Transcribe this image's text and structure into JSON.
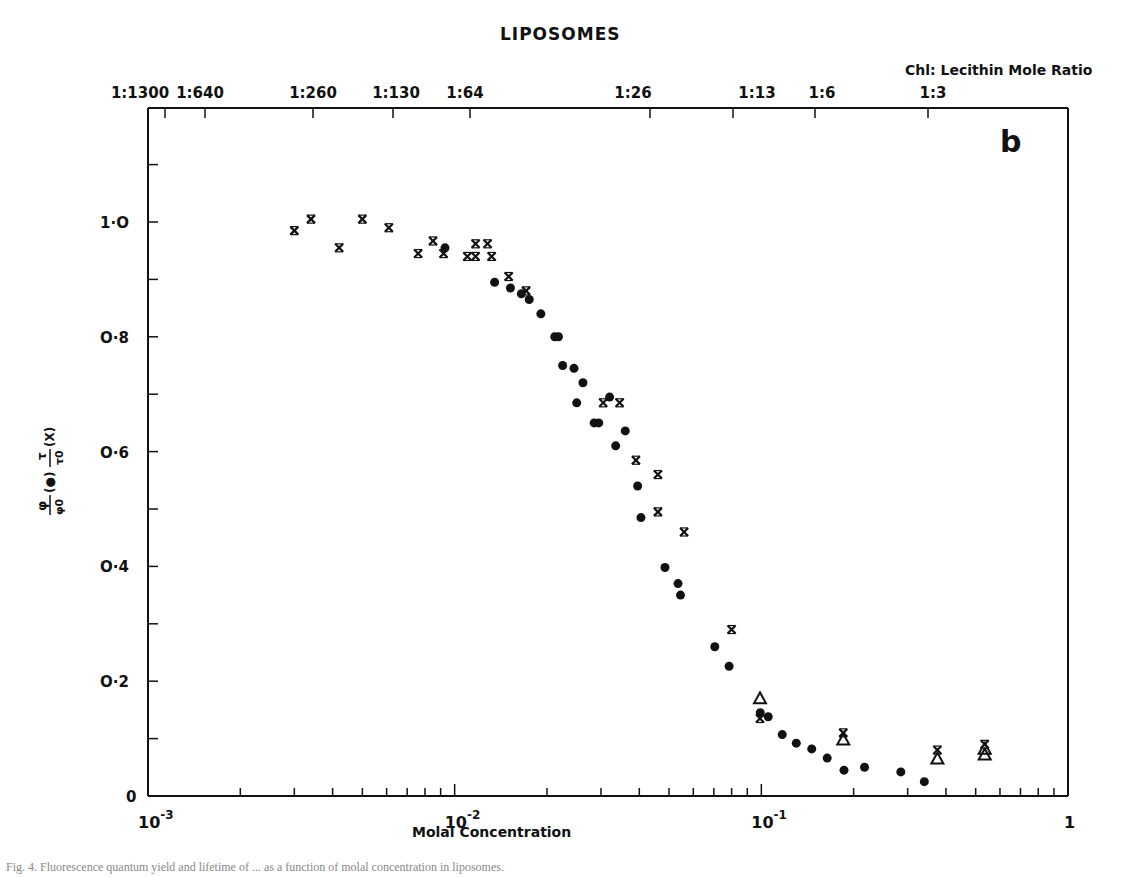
{
  "chart_data": {
    "type": "scatter",
    "title": "LIPOSOMES",
    "panel_label": "b",
    "xlabel": "Molal Concentration",
    "ylabel": "φ/φ0 (●)   τ/τ0 (X)",
    "ylabel_parts": {
      "phi_num": "φ",
      "phi_den": "φ0",
      "phi_marker": "(●)",
      "tau_num": "τ",
      "tau_den": "τ0",
      "tau_marker": "(X)"
    },
    "xscale": "log",
    "xlim": [
      0.001,
      1
    ],
    "ylim": [
      0,
      1.2
    ],
    "x_ticks": [
      {
        "value": 0.001,
        "label_base": "10",
        "label_exp": "-3"
      },
      {
        "value": 0.01,
        "label_base": "10",
        "label_exp": "-2"
      },
      {
        "value": 0.1,
        "label_base": "10",
        "label_exp": "-1"
      },
      {
        "value": 1,
        "label_base": "1",
        "label_exp": ""
      }
    ],
    "y_ticks": [
      {
        "value": 0,
        "label": "0"
      },
      {
        "value": 0.2,
        "label": "O·2"
      },
      {
        "value": 0.4,
        "label": "O·4"
      },
      {
        "value": 0.6,
        "label": "O·6"
      },
      {
        "value": 0.8,
        "label": "O·8"
      },
      {
        "value": 1.0,
        "label": "1·O"
      }
    ],
    "y_minor_ticks": [
      0.1,
      0.3,
      0.5,
      0.7,
      0.9,
      1.1
    ],
    "top_axis": {
      "title": "Chl: Lecithin Mole Ratio",
      "ticks": [
        {
          "value": 0.0023,
          "label": "1:1300"
        },
        {
          "value": 0.0046,
          "label": "1:640"
        },
        {
          "value": 0.0115,
          "label": "1:260"
        },
        {
          "value": 0.022,
          "label": "1:130"
        },
        {
          "value": 0.045,
          "label": "1:64"
        },
        {
          "value": 0.1,
          "label": "1:26"
        },
        {
          "value": 0.19,
          "label": "1:13"
        },
        {
          "value": 0.38,
          "label": "1:6"
        },
        {
          "value": 0.85,
          "label": "1:3"
        }
      ]
    },
    "series": [
      {
        "name": "φ/φ0",
        "marker": "dot",
        "points": [
          [
            0.0093,
            0.955
          ],
          [
            0.0135,
            0.895
          ],
          [
            0.0152,
            0.885
          ],
          [
            0.0165,
            0.875
          ],
          [
            0.0175,
            0.865
          ],
          [
            0.0191,
            0.84
          ],
          [
            0.0212,
            0.8
          ],
          [
            0.0218,
            0.8
          ],
          [
            0.0225,
            0.75
          ],
          [
            0.0245,
            0.745
          ],
          [
            0.0262,
            0.72
          ],
          [
            0.025,
            0.685
          ],
          [
            0.0285,
            0.65
          ],
          [
            0.0295,
            0.65
          ],
          [
            0.032,
            0.695
          ],
          [
            0.0335,
            0.61
          ],
          [
            0.036,
            0.636
          ],
          [
            0.0395,
            0.54
          ],
          [
            0.0405,
            0.485
          ],
          [
            0.0485,
            0.398
          ],
          [
            0.0535,
            0.37
          ],
          [
            0.0545,
            0.35
          ],
          [
            0.0705,
            0.26
          ],
          [
            0.0785,
            0.226
          ],
          [
            0.0992,
            0.145
          ],
          [
            0.1053,
            0.138
          ],
          [
            0.117,
            0.107
          ],
          [
            0.13,
            0.092
          ],
          [
            0.146,
            0.082
          ],
          [
            0.164,
            0.066
          ],
          [
            0.186,
            0.045
          ],
          [
            0.217,
            0.05
          ],
          [
            0.285,
            0.042
          ],
          [
            0.34,
            0.025
          ]
        ]
      },
      {
        "name": "τ/τ0",
        "marker": "x",
        "points": [
          [
            0.003,
            0.985
          ],
          [
            0.0034,
            1.005
          ],
          [
            0.0042,
            0.955
          ],
          [
            0.005,
            1.005
          ],
          [
            0.0061,
            0.99
          ],
          [
            0.0076,
            0.945
          ],
          [
            0.0085,
            0.967
          ],
          [
            0.0092,
            0.945
          ],
          [
            0.011,
            0.94
          ],
          [
            0.0117,
            0.962
          ],
          [
            0.0128,
            0.962
          ],
          [
            0.0117,
            0.94
          ],
          [
            0.0132,
            0.94
          ],
          [
            0.015,
            0.905
          ],
          [
            0.0171,
            0.88
          ],
          [
            0.0305,
            0.685
          ],
          [
            0.0345,
            0.685
          ],
          [
            0.039,
            0.585
          ],
          [
            0.046,
            0.56
          ],
          [
            0.046,
            0.495
          ],
          [
            0.056,
            0.46
          ],
          [
            0.08,
            0.29
          ],
          [
            0.099,
            0.135
          ],
          [
            0.185,
            0.11
          ],
          [
            0.375,
            0.08
          ],
          [
            0.535,
            0.09
          ]
        ]
      },
      {
        "name": "triangle",
        "marker": "triangle",
        "points": [
          [
            0.099,
            0.17
          ],
          [
            0.185,
            0.098
          ],
          [
            0.375,
            0.065
          ],
          [
            0.535,
            0.072
          ],
          [
            0.535,
            0.082
          ]
        ]
      }
    ]
  },
  "caption": "Fig. 4. Fluorescence quantum yield and lifetime of ... as a function of molal concentration in liposomes."
}
